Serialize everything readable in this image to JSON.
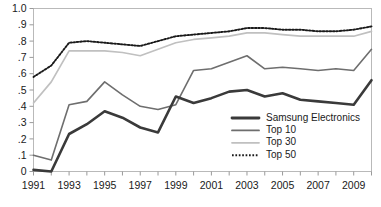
{
  "chart_data": {
    "type": "line",
    "title": "",
    "subtitle": "",
    "xlabel": "",
    "ylabel": "",
    "xlim": [
      1991,
      2010
    ],
    "ylim": [
      0,
      1.0
    ],
    "grid": false,
    "legend_position": "bottom-right-inside",
    "x": [
      1991,
      1992,
      1993,
      1994,
      1995,
      1996,
      1997,
      1998,
      1999,
      2000,
      2001,
      2002,
      2003,
      2004,
      2005,
      2006,
      2007,
      2008,
      2009,
      2010
    ],
    "xtick_labels": [
      "1991",
      "1993",
      "1995",
      "1997",
      "1999",
      "2001",
      "2003",
      "2005",
      "2007",
      "2009"
    ],
    "xtick_values": [
      1991,
      1993,
      1995,
      1997,
      1999,
      2001,
      2003,
      2005,
      2007,
      2009
    ],
    "ytick_labels": [
      "0",
      ".1",
      ".2",
      ".3",
      ".4",
      ".5",
      ".6",
      ".7",
      ".8",
      ".9",
      "1.0"
    ],
    "ytick_values": [
      0,
      0.1,
      0.2,
      0.3,
      0.4,
      0.5,
      0.6,
      0.7,
      0.8,
      0.9,
      1.0
    ],
    "series": [
      {
        "name": "Samsung Electronics",
        "color": "#3a3a3a",
        "width": 2.6,
        "style": "solid",
        "values": [
          0.01,
          -0.01,
          0.23,
          0.29,
          0.37,
          0.33,
          0.27,
          0.24,
          0.46,
          0.42,
          0.45,
          0.49,
          0.5,
          0.46,
          0.48,
          0.44,
          0.43,
          0.42,
          0.41,
          0.56
        ]
      },
      {
        "name": "Top 10",
        "color": "#6e6e6e",
        "width": 1.6,
        "style": "solid",
        "values": [
          0.1,
          0.07,
          0.41,
          0.43,
          0.55,
          0.47,
          0.4,
          0.38,
          0.41,
          0.62,
          0.63,
          0.67,
          0.71,
          0.63,
          0.64,
          0.63,
          0.62,
          0.63,
          0.62,
          0.75
        ]
      },
      {
        "name": "Top 30",
        "color": "#c0c0c0",
        "width": 1.7,
        "style": "solid",
        "values": [
          0.42,
          0.55,
          0.74,
          0.74,
          0.74,
          0.73,
          0.71,
          0.75,
          0.79,
          0.81,
          0.82,
          0.83,
          0.85,
          0.85,
          0.84,
          0.83,
          0.83,
          0.83,
          0.83,
          0.86
        ]
      },
      {
        "name": "Top 50",
        "color": "#1a1a1a",
        "width": 1.9,
        "style": "dotted",
        "values": [
          0.58,
          0.65,
          0.79,
          0.8,
          0.79,
          0.78,
          0.77,
          0.8,
          0.83,
          0.84,
          0.85,
          0.86,
          0.88,
          0.88,
          0.87,
          0.87,
          0.86,
          0.86,
          0.87,
          0.89
        ]
      }
    ],
    "legend_entries": [
      {
        "label": "Samsung Electronics",
        "color": "#3a3a3a",
        "width": 2.8,
        "style": "solid"
      },
      {
        "label": "Top 10",
        "color": "#6e6e6e",
        "width": 1.8,
        "style": "solid"
      },
      {
        "label": "Top 30",
        "color": "#c0c0c0",
        "width": 1.8,
        "style": "solid"
      },
      {
        "label": "Top 50",
        "color": "#1a1a1a",
        "width": 1.9,
        "style": "dotted"
      }
    ],
    "colors": {
      "frame": "#b9b9b9",
      "tick": "#9a9a9a",
      "text": "#1a1a1a",
      "background": "#ffffff"
    }
  }
}
